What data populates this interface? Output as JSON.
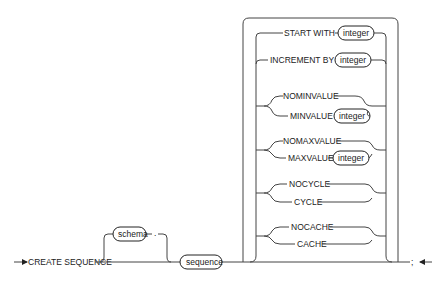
{
  "diagram": {
    "entry_keyword": "CREATE SEQUENCE",
    "schema_placeholder": "schema",
    "schema_separator": ".",
    "sequence_placeholder": "sequence",
    "terminator": ";",
    "options": {
      "start_with": {
        "keyword": "START WITH",
        "arg": "integer"
      },
      "increment_by": {
        "keyword": "INCREMENT BY",
        "arg": "integer"
      },
      "minvalue_group": {
        "alt1": "NOMINVALUE",
        "alt2": "MINVALUE",
        "arg": "integer"
      },
      "maxvalue_group": {
        "alt1": "NOMAXVALUE",
        "alt2": "MAXVALUE",
        "arg": "integer"
      },
      "cycle_group": {
        "alt1": "NOCYCLE",
        "alt2": "CYCLE"
      },
      "cache_group": {
        "alt1": "NOCACHE",
        "alt2": "CACHE"
      }
    },
    "colors": {
      "line": "#444444",
      "text": "#222222",
      "background": "#ffffff"
    }
  }
}
